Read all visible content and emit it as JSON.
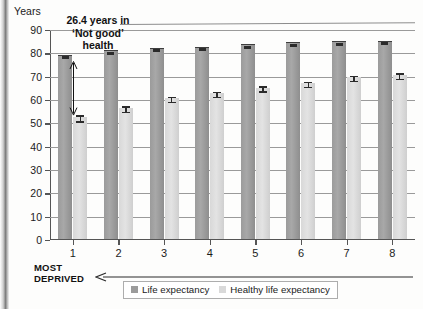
{
  "axis": {
    "y_title": "Years",
    "y_ticks": [
      0,
      10,
      20,
      30,
      40,
      50,
      60,
      70,
      80,
      90
    ],
    "x_ticks": [
      "1",
      "2",
      "3",
      "4",
      "5",
      "6",
      "7",
      "8"
    ]
  },
  "annotation": {
    "line1": "26.4 years in",
    "line2": "‘Not good’",
    "line3": "health"
  },
  "footer": {
    "most_deprived_line1": "MOST",
    "most_deprived_line2": "DEPRIVED"
  },
  "legend": {
    "items": [
      {
        "label": "Life expectancy",
        "color": "#9b9b9b"
      },
      {
        "label": "Healthy life expectancy",
        "color": "#d9d9d9"
      }
    ]
  },
  "chart_data": {
    "type": "bar",
    "title": "",
    "xlabel": "",
    "ylabel": "Years",
    "ylim": [
      0,
      90
    ],
    "grid": true,
    "legend_position": "bottom",
    "categories": [
      "1",
      "2",
      "3",
      "4",
      "5",
      "6",
      "7",
      "8"
    ],
    "series": [
      {
        "name": "Life expectancy",
        "color": "#9b9b9b",
        "values": [
          78.5,
          80.4,
          81.4,
          82.0,
          83.0,
          83.8,
          84.3,
          84.5
        ],
        "errors": [
          0.3,
          0.3,
          0.3,
          0.3,
          0.3,
          0.3,
          0.3,
          0.3
        ]
      },
      {
        "name": "Healthy life expectancy",
        "color": "#d9d9d9",
        "values": [
          52.1,
          56.1,
          60.4,
          62.4,
          64.8,
          66.7,
          69.3,
          70.3
        ],
        "errors": [
          1.3,
          1.2,
          1.1,
          1.1,
          1.1,
          1.1,
          1.1,
          1.2
        ]
      }
    ],
    "annotations": [
      {
        "text": "26.4 years in ‘Not good’ health",
        "from_value": 78.5,
        "to_value": 52.1,
        "category": "1"
      }
    ]
  }
}
